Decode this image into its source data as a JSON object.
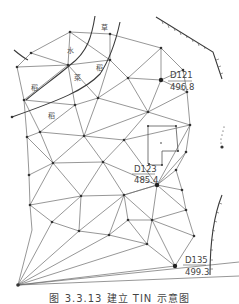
{
  "figure": {
    "caption": "图 3.3.13  建立 TIN 示意图",
    "colors": {
      "edge": "#6a6a6a",
      "feature": "#3a3a3a",
      "text": "#444444",
      "background": "#ffffff"
    },
    "control_points": [
      {
        "name": "D121",
        "elevation": "496.8",
        "x": 161,
        "y": 80,
        "label_x": 170,
        "label_y": 78
      },
      {
        "name": "D123",
        "elevation": "485.4",
        "x": 157,
        "y": 185,
        "label_x": 134,
        "label_y": 170
      },
      {
        "name": "D135",
        "elevation": "499.3",
        "x": 175,
        "y": 266,
        "label_x": 185,
        "label_y": 265
      }
    ],
    "symbols": [
      {
        "text": "草",
        "x": 101,
        "y": 30
      },
      {
        "text": "水",
        "x": 67,
        "y": 53
      },
      {
        "text": "稻",
        "x": 31,
        "y": 90
      },
      {
        "text": "稻",
        "x": 96,
        "y": 70
      },
      {
        "text": "菜",
        "x": 74,
        "y": 80
      },
      {
        "text": "稻",
        "x": 48,
        "y": 118
      }
    ]
  }
}
